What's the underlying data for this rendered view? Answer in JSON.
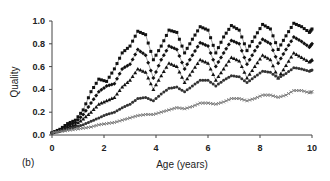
{
  "chart_data": {
    "type": "line",
    "title": "",
    "panel_label": "(b)",
    "xlabel": "Age (years)",
    "ylabel": "Quality",
    "xlim": [
      0,
      10
    ],
    "ylim": [
      0,
      1.0
    ],
    "xticks": [
      0,
      2,
      4,
      6,
      8,
      10
    ],
    "xtick_labels": [
      "0",
      "2",
      "4",
      "6",
      "8",
      "10"
    ],
    "yticks": [
      0.0,
      0.2,
      0.4,
      0.6,
      0.8,
      1.0
    ],
    "ytick_labels": [
      "0.0",
      "0.2",
      "0.4",
      "0.6",
      "0.8",
      "1.0"
    ],
    "grid": false,
    "legend": "none",
    "series": [
      {
        "name": "series-1",
        "marker": "square",
        "color": "#111111",
        "x": [
          0,
          0.3,
          0.6,
          0.9,
          1.2,
          1.5,
          1.8,
          2.1,
          2.4,
          2.7,
          3.0,
          3.3,
          3.6,
          3.9,
          4.2,
          4.5,
          4.8,
          5.1,
          5.4,
          5.7,
          6.0,
          6.3,
          6.6,
          6.9,
          7.2,
          7.5,
          7.8,
          8.1,
          8.4,
          8.7,
          9.0,
          9.3,
          9.6,
          9.9,
          10.0
        ],
        "values": [
          0.02,
          0.05,
          0.1,
          0.13,
          0.22,
          0.38,
          0.49,
          0.47,
          0.58,
          0.72,
          0.78,
          0.91,
          0.88,
          0.66,
          0.78,
          0.92,
          0.9,
          0.72,
          0.84,
          0.95,
          0.92,
          0.72,
          0.86,
          0.96,
          0.92,
          0.74,
          0.86,
          0.97,
          0.93,
          0.75,
          0.87,
          0.98,
          0.95,
          0.9,
          0.93
        ]
      },
      {
        "name": "series-2",
        "marker": "diamond",
        "color": "#111111",
        "x": [
          0,
          0.3,
          0.6,
          0.9,
          1.2,
          1.5,
          1.8,
          2.1,
          2.4,
          2.7,
          3.0,
          3.3,
          3.6,
          3.9,
          4.2,
          4.5,
          4.8,
          5.1,
          5.4,
          5.7,
          6.0,
          6.3,
          6.6,
          6.9,
          7.2,
          7.5,
          7.8,
          8.1,
          8.4,
          8.7,
          9.0,
          9.3,
          9.6,
          9.9,
          10.0
        ],
        "values": [
          0.02,
          0.04,
          0.08,
          0.11,
          0.18,
          0.28,
          0.38,
          0.43,
          0.45,
          0.58,
          0.62,
          0.75,
          0.7,
          0.5,
          0.66,
          0.78,
          0.75,
          0.58,
          0.7,
          0.81,
          0.78,
          0.6,
          0.72,
          0.83,
          0.8,
          0.62,
          0.74,
          0.84,
          0.8,
          0.63,
          0.75,
          0.86,
          0.82,
          0.77,
          0.8
        ]
      },
      {
        "name": "series-3",
        "marker": "triangle",
        "color": "#111111",
        "x": [
          0,
          0.3,
          0.6,
          0.9,
          1.2,
          1.5,
          1.8,
          2.1,
          2.4,
          2.7,
          3.0,
          3.3,
          3.6,
          3.9,
          4.2,
          4.5,
          4.8,
          5.1,
          5.4,
          5.7,
          6.0,
          6.3,
          6.6,
          6.9,
          7.2,
          7.5,
          7.8,
          8.1,
          8.4,
          8.7,
          9.0,
          9.3,
          9.6,
          9.9,
          10.0
        ],
        "values": [
          0.02,
          0.04,
          0.07,
          0.09,
          0.14,
          0.2,
          0.27,
          0.3,
          0.33,
          0.42,
          0.48,
          0.58,
          0.55,
          0.4,
          0.52,
          0.63,
          0.6,
          0.46,
          0.56,
          0.66,
          0.63,
          0.48,
          0.58,
          0.68,
          0.65,
          0.5,
          0.6,
          0.7,
          0.66,
          0.5,
          0.61,
          0.72,
          0.68,
          0.64,
          0.66
        ]
      },
      {
        "name": "series-4",
        "marker": "circle",
        "color": "#333333",
        "x": [
          0,
          0.3,
          0.6,
          0.9,
          1.2,
          1.5,
          1.8,
          2.1,
          2.4,
          2.7,
          3.0,
          3.3,
          3.6,
          3.9,
          4.2,
          4.5,
          4.8,
          5.1,
          5.4,
          5.7,
          6.0,
          6.3,
          6.6,
          6.9,
          7.2,
          7.5,
          7.8,
          8.1,
          8.4,
          8.7,
          9.0,
          9.3,
          9.6,
          9.9,
          10.0
        ],
        "values": [
          0.02,
          0.03,
          0.05,
          0.07,
          0.09,
          0.12,
          0.15,
          0.18,
          0.2,
          0.24,
          0.27,
          0.32,
          0.33,
          0.3,
          0.36,
          0.41,
          0.42,
          0.38,
          0.43,
          0.48,
          0.48,
          0.43,
          0.48,
          0.52,
          0.51,
          0.46,
          0.51,
          0.56,
          0.55,
          0.5,
          0.54,
          0.59,
          0.58,
          0.56,
          0.57
        ]
      },
      {
        "name": "series-5",
        "marker": "cross",
        "color": "#777777",
        "x": [
          0,
          0.3,
          0.6,
          0.9,
          1.2,
          1.5,
          1.8,
          2.1,
          2.4,
          2.7,
          3.0,
          3.3,
          3.6,
          3.9,
          4.2,
          4.5,
          4.8,
          5.1,
          5.4,
          5.7,
          6.0,
          6.3,
          6.6,
          6.9,
          7.2,
          7.5,
          7.8,
          8.1,
          8.4,
          8.7,
          9.0,
          9.3,
          9.6,
          9.9,
          10.0
        ],
        "values": [
          0.02,
          0.03,
          0.04,
          0.05,
          0.06,
          0.07,
          0.09,
          0.1,
          0.11,
          0.13,
          0.15,
          0.17,
          0.18,
          0.18,
          0.2,
          0.22,
          0.24,
          0.23,
          0.25,
          0.28,
          0.28,
          0.27,
          0.29,
          0.32,
          0.32,
          0.3,
          0.32,
          0.35,
          0.35,
          0.33,
          0.35,
          0.39,
          0.39,
          0.37,
          0.38
        ]
      }
    ]
  }
}
